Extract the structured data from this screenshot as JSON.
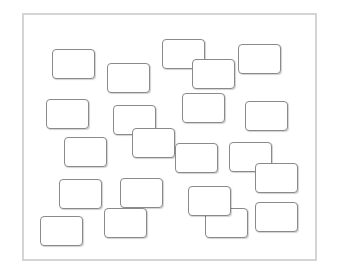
{
  "diagram": {
    "frame": {
      "x": 22,
      "y": 13,
      "w": 295,
      "h": 248,
      "border_color": "#d4d4d4"
    },
    "node_style": {
      "border_color": "#8a8a8a",
      "fill": "#ffffff",
      "radius": 4
    },
    "nodes": [
      {
        "id": "box-1",
        "x": 52,
        "y": 49,
        "w": 43,
        "h": 30,
        "label": ""
      },
      {
        "id": "box-2",
        "x": 107,
        "y": 63,
        "w": 43,
        "h": 30,
        "label": ""
      },
      {
        "id": "box-3",
        "x": 162,
        "y": 39,
        "w": 43,
        "h": 30,
        "label": ""
      },
      {
        "id": "box-4",
        "x": 192,
        "y": 59,
        "w": 43,
        "h": 30,
        "label": ""
      },
      {
        "id": "box-5",
        "x": 238,
        "y": 44,
        "w": 43,
        "h": 30,
        "label": ""
      },
      {
        "id": "box-6",
        "x": 245,
        "y": 101,
        "w": 43,
        "h": 30,
        "label": ""
      },
      {
        "id": "box-7",
        "x": 46,
        "y": 99,
        "w": 43,
        "h": 30,
        "label": ""
      },
      {
        "id": "box-8",
        "x": 113,
        "y": 105,
        "w": 43,
        "h": 30,
        "label": ""
      },
      {
        "id": "box-9",
        "x": 132,
        "y": 128,
        "w": 43,
        "h": 30,
        "label": ""
      },
      {
        "id": "box-10",
        "x": 64,
        "y": 137,
        "w": 43,
        "h": 30,
        "label": ""
      },
      {
        "id": "box-11",
        "x": 182,
        "y": 93,
        "w": 43,
        "h": 30,
        "label": ""
      },
      {
        "id": "box-12",
        "x": 175,
        "y": 143,
        "w": 43,
        "h": 30,
        "label": ""
      },
      {
        "id": "box-13",
        "x": 229,
        "y": 142,
        "w": 43,
        "h": 30,
        "label": ""
      },
      {
        "id": "box-14",
        "x": 255,
        "y": 163,
        "w": 43,
        "h": 30,
        "label": ""
      },
      {
        "id": "box-20",
        "x": 205,
        "y": 208,
        "w": 43,
        "h": 30,
        "label": ""
      },
      {
        "id": "box-15",
        "x": 188,
        "y": 186,
        "w": 43,
        "h": 30,
        "label": ""
      },
      {
        "id": "box-16",
        "x": 59,
        "y": 179,
        "w": 43,
        "h": 30,
        "label": ""
      },
      {
        "id": "box-17",
        "x": 120,
        "y": 178,
        "w": 43,
        "h": 30,
        "label": ""
      },
      {
        "id": "box-18",
        "x": 104,
        "y": 208,
        "w": 43,
        "h": 30,
        "label": ""
      },
      {
        "id": "box-19",
        "x": 40,
        "y": 216,
        "w": 43,
        "h": 30,
        "label": ""
      },
      {
        "id": "box-21",
        "x": 255,
        "y": 202,
        "w": 43,
        "h": 30,
        "label": ""
      }
    ]
  }
}
